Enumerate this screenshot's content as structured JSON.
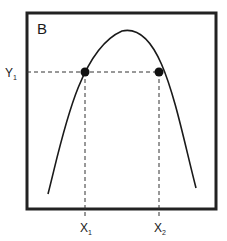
{
  "figure": {
    "panel_label": "B",
    "curve_type": "inverted parabola",
    "y_marker": {
      "label": "Y",
      "subscript": "1"
    },
    "x_markers": [
      {
        "label": "X",
        "subscript": "1"
      },
      {
        "label": "X",
        "subscript": "2"
      }
    ],
    "colors": {
      "line": "#1a1a1a",
      "frame": "#222222",
      "background": "#ffffff"
    }
  }
}
